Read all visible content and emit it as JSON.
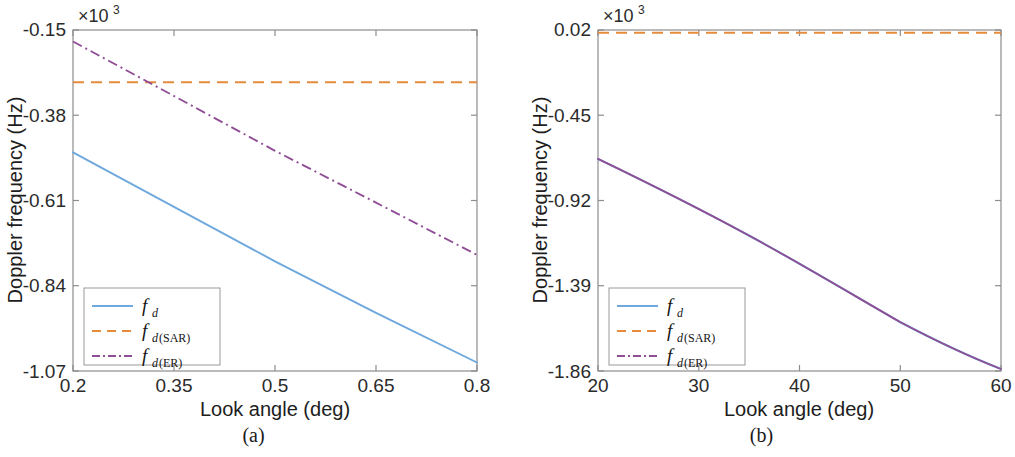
{
  "figure": {
    "background": "#ffffff",
    "panels": [
      {
        "id": "a",
        "caption": "(a)",
        "exponent_mantissa": "×10",
        "exponent_power": "3",
        "xlabel": "Look angle (deg)",
        "ylabel": "Doppler frequency (Hz)",
        "xticks": [
          "0.2",
          "0.35",
          "0.5",
          "0.65",
          "0.8"
        ],
        "yticks": [
          "-0.15",
          "-0.38",
          "-0.61",
          "-0.84",
          "-1.07"
        ],
        "legend": [
          {
            "label_main": "f",
            "label_sub": "d",
            "label_sub_up": "",
            "style": "solid",
            "color": "#6ea8dc"
          },
          {
            "label_main": "f",
            "label_sub": "d",
            "label_sub_up": "(SAR)",
            "style": "dashed",
            "color": "#e68a3c"
          },
          {
            "label_main": "f",
            "label_sub": "d",
            "label_sub_up": "(ER)",
            "style": "dashdot",
            "color": "#8f4e95"
          }
        ]
      },
      {
        "id": "b",
        "caption": "(b)",
        "exponent_mantissa": "×10",
        "exponent_power": "3",
        "xlabel": "Look angle (deg)",
        "ylabel": "Doppler frequency (Hz)",
        "xticks": [
          "20",
          "30",
          "40",
          "50",
          "60"
        ],
        "yticks": [
          "0.02",
          "-0.45",
          "-0.92",
          "-1.39",
          "-1.86"
        ],
        "legend": [
          {
            "label_main": "f",
            "label_sub": "d",
            "label_sub_up": "",
            "style": "solid",
            "color": "#6ea8dc"
          },
          {
            "label_main": "f",
            "label_sub": "d",
            "label_sub_up": "(SAR)",
            "style": "dashed",
            "color": "#e68a3c"
          },
          {
            "label_main": "f",
            "label_sub": "d",
            "label_sub_up": "(ER)",
            "style": "dashdot",
            "color": "#8f4e95"
          }
        ]
      }
    ]
  },
  "chart_data": [
    {
      "type": "line",
      "panel": "a",
      "title": "",
      "xlabel": "Look angle (deg)",
      "ylabel": "Doppler frequency (Hz)",
      "y_exponent": 1000,
      "xlim": [
        0.2,
        0.8
      ],
      "ylim": [
        -1.07,
        -0.15
      ],
      "xticks": [
        0.2,
        0.35,
        0.5,
        0.65,
        0.8
      ],
      "yticks": [
        -0.15,
        -0.38,
        -0.61,
        -0.84,
        -1.07
      ],
      "grid": false,
      "legend_position": "lower left",
      "series": [
        {
          "name": "f_d",
          "style": "solid",
          "color": "#6ea8dc",
          "x": [
            0.2,
            0.35,
            0.5,
            0.65,
            0.8
          ],
          "y": [
            -0.485,
            -0.632,
            -0.779,
            -0.918,
            -1.052
          ]
        },
        {
          "name": "f_d(SAR)",
          "style": "dashed",
          "color": "#e68a3c",
          "x": [
            0.2,
            0.35,
            0.5,
            0.65,
            0.8
          ],
          "y": [
            -0.293,
            -0.293,
            -0.293,
            -0.293,
            -0.293
          ]
        },
        {
          "name": "f_d(ER)",
          "style": "dashdot",
          "color": "#8f4e95",
          "x": [
            0.2,
            0.35,
            0.5,
            0.65,
            0.8
          ],
          "y": [
            -0.182,
            -0.329,
            -0.477,
            -0.617,
            -0.758
          ]
        }
      ]
    },
    {
      "type": "line",
      "panel": "b",
      "title": "",
      "xlabel": "Look angle (deg)",
      "ylabel": "Doppler frequency (Hz)",
      "y_exponent": 1000,
      "xlim": [
        20,
        60
      ],
      "ylim": [
        -1.86,
        0.02
      ],
      "xticks": [
        20,
        30,
        40,
        50,
        60
      ],
      "yticks": [
        0.02,
        -0.45,
        -0.92,
        -1.39,
        -1.86
      ],
      "grid": false,
      "legend_position": "lower left",
      "series": [
        {
          "name": "f_d",
          "style": "solid",
          "color": "#6ea8dc",
          "x": [
            20,
            25,
            30,
            35,
            40,
            45,
            50,
            55,
            60
          ],
          "y": [
            -0.69,
            -0.815,
            -0.945,
            -1.08,
            -1.215,
            -1.35,
            -1.49,
            -1.64,
            -1.84
          ]
        },
        {
          "name": "f_d(SAR)",
          "style": "dashed",
          "color": "#e68a3c",
          "x": [
            20,
            30,
            40,
            50,
            60
          ],
          "y": [
            0.015,
            0.015,
            0.015,
            0.015,
            0.015
          ]
        },
        {
          "name": "f_d(ER)",
          "style": "dashdot",
          "color": "#8f4e95",
          "x": [
            20,
            25,
            30,
            35,
            40,
            45,
            50,
            55,
            60
          ],
          "y": [
            -0.69,
            -0.815,
            -0.945,
            -1.08,
            -1.215,
            -1.35,
            -1.49,
            -1.64,
            -1.84
          ]
        }
      ]
    }
  ]
}
